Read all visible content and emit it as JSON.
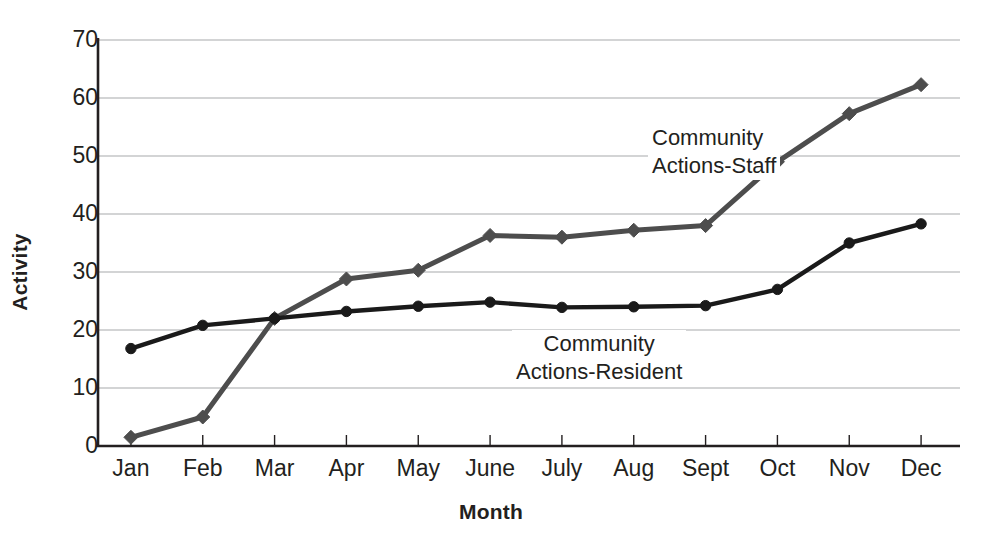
{
  "chart_data": {
    "type": "line",
    "title": "",
    "xlabel": "Month",
    "ylabel": "Activity",
    "categories": [
      "Jan",
      "Feb",
      "Mar",
      "Apr",
      "May",
      "June",
      "July",
      "Aug",
      "Sept",
      "Oct",
      "Nov",
      "Dec"
    ],
    "ylim": [
      0,
      70
    ],
    "yticks": [
      0,
      10,
      20,
      30,
      40,
      50,
      60,
      70
    ],
    "grid": "horizontal",
    "legend": "inline-annotations",
    "series": [
      {
        "name": "Community Actions-Staff",
        "color": "#4d4d4d",
        "marker": "diamond",
        "values": [
          1.5,
          5.0,
          22.0,
          28.8,
          30.3,
          36.3,
          36.0,
          37.2,
          38.0,
          49.0,
          57.3,
          62.3
        ]
      },
      {
        "name": "Community Actions-Resident",
        "color": "#1a1a1a",
        "marker": "circle",
        "values": [
          16.8,
          20.8,
          22.0,
          23.2,
          24.1,
          24.8,
          23.9,
          24.0,
          24.2,
          27.0,
          35.0,
          38.3
        ]
      }
    ],
    "annotations": [
      {
        "id": "staff",
        "line1": "Community",
        "line2": "Actions-Staff"
      },
      {
        "id": "resident",
        "line1": "Community",
        "line2": "Actions-Resident"
      }
    ]
  },
  "axis": {
    "y_title": "Activity",
    "x_title": "Month"
  },
  "colors": {
    "staff": "#4d4d4d",
    "resident": "#1a1a1a",
    "grid": "#a7a9ac",
    "axis": "#231f20",
    "background": "#ffffff"
  }
}
